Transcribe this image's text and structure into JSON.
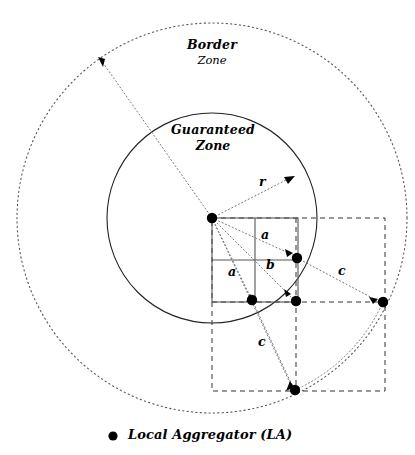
{
  "figure": {
    "width": 415,
    "height": 455,
    "background": "#ffffff",
    "stroke_color": "#000000",
    "dot_color": "#000000"
  },
  "labels": {
    "border_zone_title": "Border",
    "border_zone_sub": "Zone",
    "guaranteed_zone_title": "Guaranteed",
    "guaranteed_zone_sub": "Zone",
    "radius_label": "r",
    "cell_label_a_top": "a",
    "cell_label_a_left": "a",
    "cell_label_b": "b",
    "distance_label_c_right": "c",
    "distance_label_c_bottom": "c"
  },
  "legend": {
    "marker": "dot",
    "text": "Local Aggregator (LA)"
  },
  "geometry": {
    "center": {
      "x": 212,
      "y": 218
    },
    "outer_circle": {
      "cx": 212,
      "cy": 218,
      "r": 195,
      "style": "dotted",
      "name": "border-zone-boundary"
    },
    "inner_circle": {
      "cx": 212,
      "cy": 218,
      "r": 105,
      "style": "solid",
      "name": "guaranteed-zone-boundary"
    },
    "solid_grid": {
      "x": 212,
      "y": 218,
      "w": 86,
      "h": 84,
      "cols": 2,
      "rows": 2
    },
    "dashed_region": {
      "x": 212,
      "y": 218,
      "right": 385,
      "bottom": 391
    },
    "aggregators": [
      {
        "id": "la-center",
        "x": 212,
        "y": 218
      },
      {
        "id": "la-cell-corner",
        "x": 297,
        "y": 258
      },
      {
        "id": "la-bottom-inner",
        "x": 252,
        "y": 300
      },
      {
        "id": "la-bottom-corner",
        "x": 296,
        "y": 301
      },
      {
        "id": "la-far-right",
        "x": 383,
        "y": 302
      },
      {
        "id": "la-far-bottom",
        "x": 295,
        "y": 390
      }
    ]
  }
}
